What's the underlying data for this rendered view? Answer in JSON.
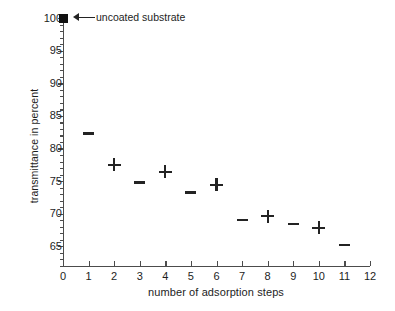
{
  "chart_data": {
    "type": "scatter",
    "title": "",
    "xlabel": "number of adsorption steps",
    "ylabel": "transmittance in percent",
    "xlim": [
      0,
      12
    ],
    "ylim": [
      61.8,
      100.5
    ],
    "grid": false,
    "legend": "none",
    "x_ticks": [
      0,
      1,
      2,
      3,
      4,
      5,
      6,
      7,
      8,
      9,
      10,
      11,
      12
    ],
    "x_tick_labels": [
      "0",
      "1",
      "2",
      "3",
      "4",
      "5",
      "6",
      "7",
      "8",
      "9",
      "10",
      "11",
      "12"
    ],
    "y_ticks": [
      65,
      70,
      75,
      80,
      85,
      90,
      95,
      100
    ],
    "y_tick_labels": [
      "65",
      "70",
      "75",
      "80",
      "85",
      "90",
      "95",
      "100"
    ],
    "y_minor_tick_interval": 1,
    "series": [
      {
        "name": "uncoated substrate",
        "marker": "filled-square",
        "color": "#111111",
        "points": [
          {
            "x": 0,
            "y": 100
          }
        ]
      },
      {
        "name": "coated samples",
        "marker": "mixed",
        "color": "#232323",
        "points": [
          {
            "x": 1,
            "y": 82.3,
            "marker": "dash"
          },
          {
            "x": 2,
            "y": 77.5,
            "marker": "plus"
          },
          {
            "x": 3,
            "y": 74.8,
            "marker": "dash"
          },
          {
            "x": 4,
            "y": 76.4,
            "marker": "plus"
          },
          {
            "x": 5,
            "y": 73.2,
            "marker": "dash"
          },
          {
            "x": 6,
            "y": 74.4,
            "marker": "plus"
          },
          {
            "x": 7,
            "y": 69.0,
            "marker": "dash"
          },
          {
            "x": 8,
            "y": 69.6,
            "marker": "plus"
          },
          {
            "x": 9,
            "y": 68.4,
            "marker": "dash"
          },
          {
            "x": 10,
            "y": 67.8,
            "marker": "plus"
          },
          {
            "x": 11,
            "y": 65.2,
            "marker": "dash"
          }
        ]
      }
    ],
    "annotations": [
      {
        "text": "uncoated substrate",
        "points_to": {
          "x": 0,
          "y": 100
        },
        "arrow": "left"
      }
    ],
    "colors": {
      "axis": "#4c4c4c",
      "marker": "#232323",
      "text": "#1d1d1d",
      "background": "#ffffff"
    }
  }
}
